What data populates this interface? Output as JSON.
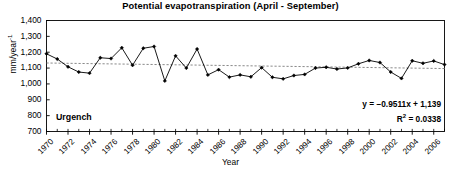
{
  "chart_data": {
    "type": "line",
    "title": "Potential evapotranspiration (April - September)",
    "xlabel": "Year",
    "ylabel": "mm/year",
    "ylabel_exponent": "-1",
    "series_label": "Urgench",
    "xlim": [
      1970,
      2007
    ],
    "ylim": [
      700,
      1400
    ],
    "ytick_labels": [
      "700",
      "800",
      "900",
      "1,000",
      "1,100",
      "1,200",
      "1,300",
      "1,400"
    ],
    "ytick_values": [
      700,
      800,
      900,
      1000,
      1100,
      1200,
      1300,
      1400
    ],
    "xtick_labels": [
      "1970",
      "1972",
      "1974",
      "1976",
      "1978",
      "1980",
      "1982",
      "1984",
      "1986",
      "1988",
      "1990",
      "1992",
      "1994",
      "1996",
      "1998",
      "2000",
      "2002",
      "2004",
      "2006"
    ],
    "xtick_values": [
      1970,
      1972,
      1974,
      1976,
      1978,
      1980,
      1982,
      1984,
      1986,
      1988,
      1990,
      1992,
      1994,
      1996,
      1998,
      2000,
      2002,
      2004,
      2006
    ],
    "minor_tick_step": 1,
    "grid": false,
    "legend": "none",
    "x": [
      1970,
      1971,
      1972,
      1973,
      1974,
      1975,
      1976,
      1977,
      1978,
      1979,
      1980,
      1981,
      1982,
      1983,
      1984,
      1985,
      1986,
      1987,
      1988,
      1989,
      1990,
      1991,
      1992,
      1993,
      1994,
      1995,
      1996,
      1997,
      1998,
      1999,
      2000,
      2001,
      2002,
      2003,
      2004,
      2005,
      2006,
      2007
    ],
    "values": [
      1190,
      1157,
      1108,
      1075,
      1068,
      1165,
      1160,
      1228,
      1118,
      1225,
      1236,
      1019,
      1177,
      1100,
      1220,
      1057,
      1090,
      1043,
      1057,
      1045,
      1103,
      1042,
      1032,
      1053,
      1060,
      1100,
      1105,
      1094,
      1101,
      1127,
      1148,
      1135,
      1075,
      1035,
      1146,
      1130,
      1145,
      1122
    ],
    "marker": "filled-diamond",
    "line_color": "#000000",
    "trendline": {
      "equation": "y = −0.9511x + 1,139",
      "r_squared_label": "R",
      "r_squared_exponent": "2",
      "r_squared_value": "= 0.0338",
      "slope": -0.9511,
      "intercept": 1139,
      "r2": 0.0338,
      "style": "dashed",
      "color": "#8a8a8a",
      "start_value": 1132,
      "end_value": 1097
    },
    "axis_color": "#000000",
    "background": "#ffffff"
  }
}
